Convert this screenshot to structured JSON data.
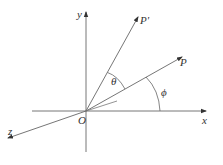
{
  "diagram": {
    "type": "3d-coordinate-rotation",
    "colors": {
      "line": "#555555",
      "text": "#333333",
      "background": "#ffffff"
    },
    "origin": {
      "label": "O",
      "x": 86,
      "y": 111
    },
    "axes": [
      {
        "name": "x",
        "label": "x",
        "end": [
          206,
          111
        ]
      },
      {
        "name": "y",
        "label": "y",
        "end": [
          86,
          12
        ]
      },
      {
        "name": "z",
        "label": "z",
        "end": [
          8,
          138
        ]
      }
    ],
    "vectors": [
      {
        "name": "P",
        "label": "P",
        "end": [
          182,
          57
        ]
      },
      {
        "name": "P-prime",
        "label": "P'",
        "end": [
          138,
          17
        ]
      }
    ],
    "angles": [
      {
        "name": "theta",
        "label": "θ",
        "between": [
          "P",
          "P'"
        ]
      },
      {
        "name": "phi",
        "label": "ϕ",
        "between": [
          "x",
          "P"
        ]
      }
    ],
    "caption": ""
  }
}
